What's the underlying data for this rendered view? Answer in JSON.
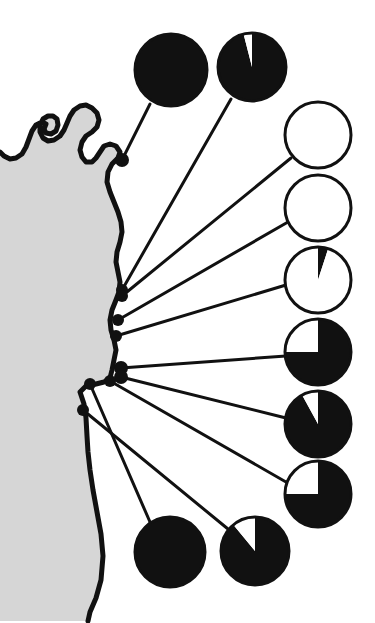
{
  "figure": {
    "title": "Coastal sampling site pie-chart map",
    "background_color": "#ffffff",
    "land_color": "#d6d6d6",
    "sea_color": "#ffffff",
    "ink_color": "#111111",
    "width": 375,
    "height": 623
  },
  "chart_data": {
    "type": "pie",
    "title": "Coastal sampling site pie-chart map",
    "subtitle": "",
    "xlabel": "",
    "ylabel": "",
    "legend_position": "none",
    "grid": false,
    "slice_labels": [
      "black",
      "white"
    ],
    "slice_colors": [
      "#111111",
      "#ffffff"
    ],
    "units": "percent",
    "charts": [
      {
        "id": "pie-1",
        "site": "site-1",
        "values": [
          100,
          0
        ],
        "black_percent": 100,
        "white_percent": 0,
        "cx": 171,
        "cy": 70,
        "r": 36,
        "start_angle": 0,
        "anchor_x": 122,
        "anchor_y": 160,
        "leader_x": 150,
        "leader_y": 104
      },
      {
        "id": "pie-2",
        "site": "site-2",
        "values": [
          96,
          4
        ],
        "black_percent": 96,
        "white_percent": 4,
        "cx": 252,
        "cy": 67,
        "r": 34,
        "start_angle": 0,
        "anchor_x": 122,
        "anchor_y": 290,
        "leader_x": 231,
        "leader_y": 99
      },
      {
        "id": "pie-3",
        "site": "site-3",
        "values": [
          0,
          100
        ],
        "black_percent": 0,
        "white_percent": 100,
        "cx": 318,
        "cy": 135,
        "r": 33,
        "start_angle": 0,
        "anchor_x": 122,
        "anchor_y": 296,
        "leader_x": 291,
        "leader_y": 158
      },
      {
        "id": "pie-4",
        "site": "site-4",
        "values": [
          0,
          100
        ],
        "black_percent": 0,
        "white_percent": 100,
        "cx": 318,
        "cy": 208,
        "r": 33,
        "start_angle": 0,
        "anchor_x": 118,
        "anchor_y": 320,
        "leader_x": 288,
        "leader_y": 222
      },
      {
        "id": "pie-5",
        "site": "site-5",
        "values": [
          5,
          95
        ],
        "black_percent": 5,
        "white_percent": 95,
        "cx": 318,
        "cy": 280,
        "r": 33,
        "start_angle": 0,
        "anchor_x": 116,
        "anchor_y": 336,
        "leader_x": 286,
        "leader_y": 285
      },
      {
        "id": "pie-6",
        "site": "site-6",
        "values": [
          75,
          25
        ],
        "black_percent": 75,
        "white_percent": 25,
        "cx": 318,
        "cy": 352,
        "r": 33,
        "start_angle": 0,
        "anchor_x": 121,
        "anchor_y": 368,
        "leader_x": 286,
        "leader_y": 356
      },
      {
        "id": "pie-7",
        "site": "site-7",
        "values": [
          92,
          8
        ],
        "black_percent": 92,
        "white_percent": 8,
        "cx": 318,
        "cy": 424,
        "r": 33,
        "start_angle": 0,
        "anchor_x": 121,
        "anchor_y": 377,
        "leader_x": 286,
        "leader_y": 418
      },
      {
        "id": "pie-8",
        "site": "site-8",
        "values": [
          75,
          25
        ],
        "black_percent": 75,
        "white_percent": 25,
        "cx": 318,
        "cy": 494,
        "r": 33,
        "start_angle": 0,
        "anchor_x": 110,
        "anchor_y": 381,
        "leader_x": 286,
        "leader_y": 482
      },
      {
        "id": "pie-9",
        "site": "site-9",
        "values": [
          100,
          0
        ],
        "black_percent": 100,
        "white_percent": 0,
        "cx": 170,
        "cy": 552,
        "r": 35,
        "start_angle": 0,
        "anchor_x": 90,
        "anchor_y": 384,
        "leader_x": 150,
        "leader_y": 522
      },
      {
        "id": "pie-10",
        "site": "site-10",
        "values": [
          89,
          11
        ],
        "black_percent": 89,
        "white_percent": 11,
        "cx": 255,
        "cy": 551,
        "r": 34,
        "start_angle": 0,
        "anchor_x": 83,
        "anchor_y": 410,
        "leader_x": 228,
        "leader_y": 529
      }
    ]
  },
  "map": {
    "land_path": "M -10,621 L 88,621 L 90,612 L 96,598 L 101,580 L 103,556 L 101,534 L 97,512 L 93,490 L 90,470 L 88,452 L 87,436 L 86,418 L 84,404 L 80,392 L 86,386 L 96,384 L 104,382 L 110,378 L 112,370 L 114,360 L 116,350 L 114,340 L 111,330 L 110,320 L 112,310 L 116,300 L 119,292 L 120,282 L 118,272 L 116,262 L 117,252 L 120,242 L 122,232 L 121,222 L 118,212 L 114,202 L 110,192 L 107,182 L 108,172 L 112,164 L 118,158 L 120,152 L 116,146 L 110,144 L 104,146 L 100,152 L 96,158 L 92,162 L 86,162 L 82,157 L 80,150 L 82,142 L 86,136 L 92,132 L 97,127 L 99,120 L 97,113 L 92,108 L 86,105 L 80,106 L 74,110 L 70,116 L 67,123 L 64,130 L 60,136 L 54,140 L 48,141 L 43,138 L 40,132 L 40,125 L 43,119 L 48,116 L 53,116 L 57,119 L 58,125 L 56,131 L 51,134 L 46,133 L 44,129 L 46,124 L 42,122 L 36,125 L 32,131 L 29,139 L 26,147 L 22,154 L 16,158 L 10,159 L 4,156 L 0,152 L -10,152 Z",
    "coast_line": "M -10,152 L 0,152 L 4,156 L 10,159 L 16,158 L 22,154 L 26,147 L 29,139 L 32,131 L 36,125 L 42,122 L 46,124 L 44,129 L 46,133 L 51,134 L 56,131 L 58,125 L 57,119 L 53,116 L 48,116 L 43,119 L 40,125 L 40,132 L 43,138 L 48,141 L 54,140 L 60,136 L 64,130 L 67,123 L 70,116 L 74,110 L 80,106 L 86,105 L 92,108 L 97,113 L 99,120 L 97,127 L 92,132 L 86,136 L 82,142 L 80,150 L 82,157 L 86,162 L 92,162 L 96,158 L 100,152 L 104,146 L 110,144 L 116,146 L 120,152 L 118,158 L 112,164 L 108,172 L 107,182 L 110,192 L 114,202 L 118,212 L 121,222 L 122,232 L 120,242 L 117,252 L 116,262 L 118,272 L 120,282 L 119,292 L 116,300 L 112,310 L 110,320 L 111,330 L 114,340 L 116,350 L 114,360 L 112,370 L 110,378 L 104,382 L 96,384 L 86,386 L 80,392 L 84,404 L 86,418 L 87,436 L 88,452 L 90,470 L 93,490 L 97,512 L 101,534 L 103,556 L 101,580 L 96,598 L 90,612 L 88,621",
    "sites": [
      {
        "id": "site-1",
        "x": 122,
        "y": 160,
        "r": 7
      },
      {
        "id": "site-2",
        "x": 122,
        "y": 290,
        "r": 6
      },
      {
        "id": "site-3",
        "x": 122,
        "y": 296,
        "r": 6
      },
      {
        "id": "site-4",
        "x": 118,
        "y": 320,
        "r": 6
      },
      {
        "id": "site-5",
        "x": 116,
        "y": 336,
        "r": 6
      },
      {
        "id": "site-6",
        "x": 121,
        "y": 368,
        "r": 7
      },
      {
        "id": "site-7",
        "x": 121,
        "y": 377,
        "r": 7
      },
      {
        "id": "site-8",
        "x": 110,
        "y": 381,
        "r": 6
      },
      {
        "id": "site-9",
        "x": 90,
        "y": 384,
        "r": 6
      },
      {
        "id": "site-10",
        "x": 83,
        "y": 410,
        "r": 6
      }
    ]
  }
}
